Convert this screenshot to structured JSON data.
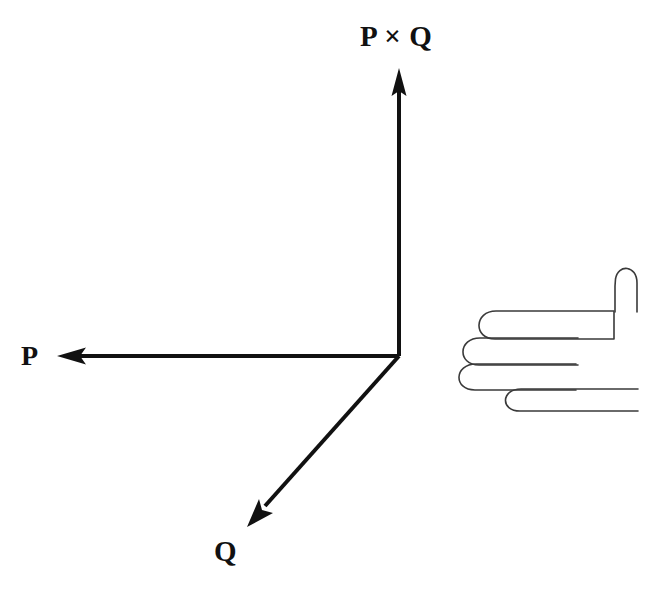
{
  "figure": {
    "background_color": "#ffffff",
    "width": 668,
    "height": 591
  },
  "labels": {
    "cross_product": "P × Q",
    "vector_p": "P",
    "vector_q": "Q"
  },
  "colors": {
    "arrow_stroke": "#111111",
    "hand_stroke": "#3a3a3a",
    "text": "#111111"
  },
  "vectors": [
    {
      "name": "cross-product-vector",
      "label": "P × Q",
      "direction": "up",
      "origin": [
        399,
        356
      ],
      "tip": [
        399,
        70
      ],
      "stroke_width": 4
    },
    {
      "name": "vector-p",
      "label": "P",
      "direction": "left",
      "origin": [
        399,
        356
      ],
      "tip": [
        58,
        356
      ],
      "stroke_width": 4
    },
    {
      "name": "vector-q",
      "label": "Q",
      "direction": "down-left",
      "origin": [
        399,
        356
      ],
      "tip": [
        248,
        526
      ],
      "stroke_width": 4
    }
  ],
  "hand": {
    "name": "right-hand-illustration",
    "description": "Outline of a right hand with thumb pointing up and four fingers curling",
    "thumb": {
      "tip_y": 262,
      "left_x": 614,
      "right_x": 637,
      "base_y": 312
    },
    "fingers": [
      {
        "name": "index-finger",
        "curl_left_x": 483,
        "top_y": 311,
        "bottom_y": 338,
        "right_x": 614
      },
      {
        "name": "middle-finger",
        "curl_left_x": 467,
        "top_y": 338,
        "bottom_y": 364,
        "right_x": 578
      },
      {
        "name": "ring-finger",
        "curl_left_x": 463,
        "top_y": 364,
        "bottom_y": 389,
        "right_x": 576
      },
      {
        "name": "pinky-finger",
        "curl_left_x": 508,
        "top_y": 389,
        "bottom_y": 410,
        "right_x": 638
      }
    ],
    "stroke_width": 1.6
  }
}
